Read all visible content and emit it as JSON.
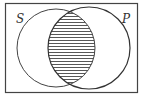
{
  "diagram": {
    "type": "venn",
    "sets": [
      {
        "label": "S",
        "position": "left"
      },
      {
        "label": "P",
        "position": "right"
      }
    ],
    "shaded_region": "S ∩ P",
    "shading_style": "horizontal-hatch",
    "colors": {
      "stroke": "#333333",
      "background": "#ffffff"
    }
  }
}
